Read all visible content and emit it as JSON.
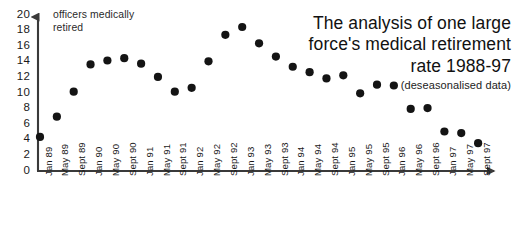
{
  "title": {
    "line1": "The analysis of one large",
    "line2": "force's medical retirement",
    "line3": "rate 1988-97",
    "subtitle": "(deseasonalised data)"
  },
  "series_note": {
    "line1": "officers medically",
    "line2": "retired"
  },
  "colors": {
    "marker": "#141414",
    "axis": "#3a3a3a",
    "text": "#1a1a1a",
    "background": "#ffffff"
  },
  "chart_data": {
    "type": "scatter",
    "title": "The analysis of one large force's medical retirement rate 1988-97",
    "subtitle": "(deseasonalised data)",
    "xlabel": "",
    "ylabel": "officers medically retired",
    "ylim": [
      0,
      20
    ],
    "ytick_step": 2,
    "yticks": [
      20,
      18,
      16,
      14,
      12,
      10,
      8,
      6,
      4,
      2,
      0
    ],
    "grid": false,
    "legend": false,
    "categories": [
      "Jan 89",
      "May 89",
      "Sept 89",
      "Jan 90",
      "May 90",
      "Sept 90",
      "Jan 91",
      "May 91",
      "Sept 91",
      "Jan 92",
      "May 92",
      "Sept 92",
      "Jan 93",
      "May 93",
      "Sept 93",
      "Jan 94",
      "May 94",
      "Sept 94",
      "Jan 95",
      "May 95",
      "Sept 95",
      "Jan 96",
      "May 96",
      "Sept 96",
      "Jan 97",
      "May 97",
      "Sept 97"
    ],
    "values": [
      4.3,
      6.9,
      10.1,
      13.6,
      14.1,
      14.4,
      13.7,
      12.0,
      10.1,
      10.6,
      14.0,
      17.4,
      18.4,
      16.3,
      14.6,
      13.3,
      12.6,
      11.8,
      12.2,
      9.9,
      11.0,
      10.9,
      7.9,
      8.0,
      5.0,
      4.8,
      3.5
    ]
  }
}
